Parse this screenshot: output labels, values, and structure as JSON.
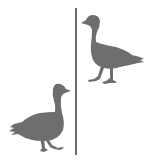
{
  "scene": {
    "background": "#ffffff",
    "divider": {
      "color": "#6b6b6b",
      "x": 76,
      "y1": 8,
      "y2": 155,
      "width": 2
    },
    "figures": [
      {
        "id": "goose-top-right",
        "label": "goose silhouette facing left",
        "fill": "#6e6e6e",
        "side": "right of divider",
        "facing": "left"
      },
      {
        "id": "goose-bottom-left",
        "label": "goose silhouette facing right",
        "fill": "#6e6e6e",
        "side": "left of divider",
        "facing": "right"
      }
    ]
  }
}
